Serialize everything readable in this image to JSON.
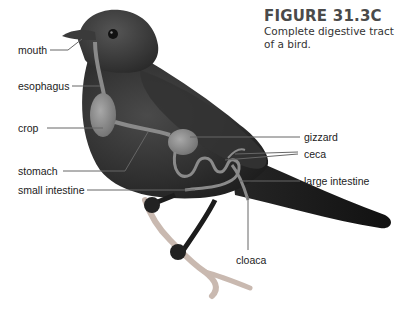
{
  "figure": {
    "title": "FIGURE 31.3C",
    "description_line1": "Complete digestive tract",
    "description_line2": "of a bird."
  },
  "labels": {
    "mouth": "mouth",
    "esophagus": "esophagus",
    "crop": "crop",
    "stomach": "stomach",
    "small_intestine": "small intestine",
    "gizzard": "gizzard",
    "ceca": "ceca",
    "large_intestine": "large intestine",
    "cloaca": "cloaca"
  },
  "colors": {
    "bird_body": "#2b2b2b",
    "organ": "#8a8a8a",
    "leader_line": "#666666",
    "branch": "#c9b9b0",
    "text": "#222222"
  }
}
